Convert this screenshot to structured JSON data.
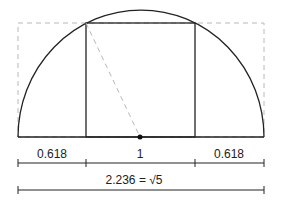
{
  "diagram": {
    "segments": [
      {
        "label": "0.618"
      },
      {
        "label": "1"
      },
      {
        "label": "0.618"
      }
    ],
    "total_label": "2.236 = √5",
    "colors": {
      "stroke": "#222222",
      "dashed": "#b8b8b8"
    }
  }
}
